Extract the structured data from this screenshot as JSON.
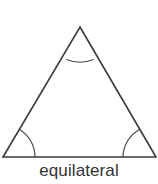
{
  "figure": {
    "caption": "equilateral",
    "shape_name": "triangle",
    "stroke_color": "#3a3a3a",
    "arc_color": "#4a4a4a",
    "text_color": "#333333",
    "background_color": "#ffffff",
    "vertices": {
      "apex": [
        80,
        27
      ],
      "bottom_left": [
        3,
        157
      ],
      "bottom_right": [
        156,
        157
      ]
    },
    "angle_marks": [
      {
        "name": "apex-angle",
        "arc_path": "M 66.5 59.5 A 36 36 0 0 0 93.5 59.5"
      },
      {
        "name": "bottom-left-angle",
        "arc_path": "M 19.5 129.5 A 32 32 0 0 1 35 157"
      },
      {
        "name": "bottom-right-angle",
        "arc_path": "M 123 157 A 32 32 0 0 1 139.5 129.5"
      }
    ],
    "side_path": "M 80 27 L 156 157 L 3 157 Z"
  }
}
